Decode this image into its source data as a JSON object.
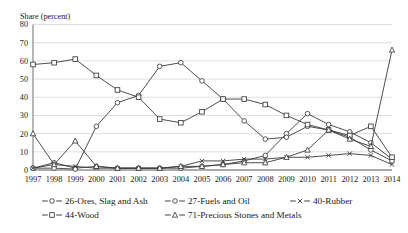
{
  "chart_data": {
    "type": "line",
    "title": "",
    "ylabel": "Share (percent)",
    "xlabel": "",
    "ylim": [
      0,
      80
    ],
    "yticks": [
      0,
      10,
      20,
      30,
      40,
      50,
      60,
      70,
      80
    ],
    "grid": true,
    "legend_position": "bottom",
    "categories": [
      "1997",
      "1998",
      "1999",
      "2000",
      "2001",
      "2002",
      "2003",
      "2004",
      "2005",
      "2006",
      "2007",
      "2008",
      "2009",
      "2010",
      "2011",
      "2012",
      "2013",
      "2014"
    ],
    "series": [
      {
        "name": "26-Ores, Slag and Ash",
        "marker": "circle",
        "values": [
          1,
          4,
          1,
          2,
          1,
          1,
          1,
          1,
          2,
          3,
          5,
          8,
          20,
          31,
          25,
          21,
          15,
          6
        ]
      },
      {
        "name": "27-Fuels and Oil",
        "marker": "circle",
        "values": [
          1,
          1,
          0.5,
          24,
          37,
          41,
          57,
          59,
          49,
          39,
          27,
          17,
          18,
          24,
          22,
          18,
          11,
          5
        ]
      },
      {
        "name": "40-Rubber",
        "marker": "x",
        "values": [
          1,
          3,
          2,
          1,
          1,
          1,
          1,
          2,
          5,
          5,
          6,
          6,
          7,
          7,
          8,
          9,
          8,
          3
        ]
      },
      {
        "name": "44-Wood",
        "marker": "square",
        "values": [
          58,
          59,
          61,
          52,
          44,
          40,
          28,
          26,
          32,
          39,
          39,
          36,
          30,
          25,
          22,
          19,
          24,
          7
        ]
      },
      {
        "name": "71-Precious Stones and Metals",
        "marker": "triangle",
        "values": [
          20,
          3,
          16,
          2,
          1,
          1,
          1,
          2,
          2,
          3,
          4,
          4,
          7,
          11,
          22,
          17,
          13,
          66
        ]
      }
    ]
  },
  "axis": {
    "y_title": "Share (percent)"
  },
  "legend": {
    "items": [
      {
        "label": "26-Ores, Slag and Ash",
        "marker": "circle"
      },
      {
        "label": "27-Fuels and Oil",
        "marker": "circle"
      },
      {
        "label": "40-Rubber",
        "marker": "x"
      },
      {
        "label": "44-Wood",
        "marker": "square"
      },
      {
        "label": "71-Precious Stones and Metals",
        "marker": "triangle"
      }
    ]
  },
  "colors": {
    "line": "#3a3a3a",
    "grid": "#c8c8c8",
    "axis": "#4a4a4a",
    "text": "#1a1a1a",
    "background": "#ffffff"
  }
}
